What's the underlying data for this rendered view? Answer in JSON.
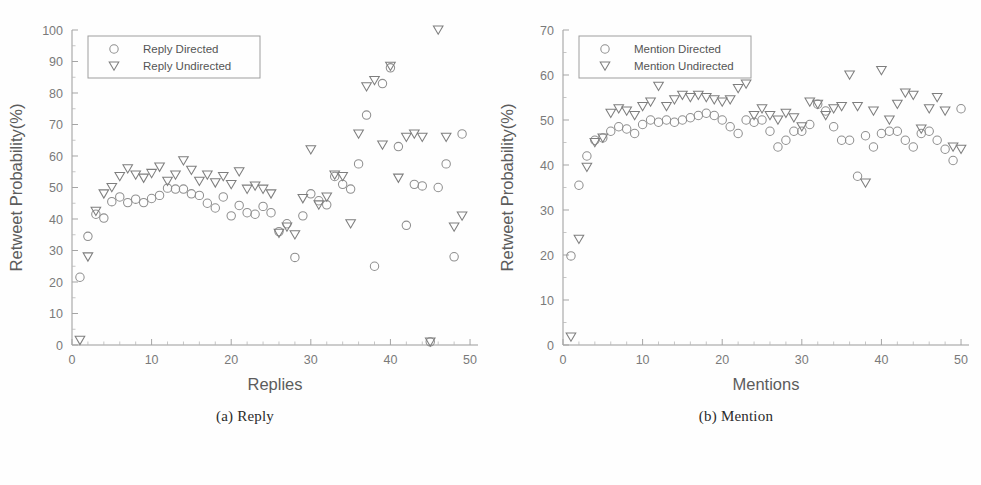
{
  "figure": {
    "background_color": "#fefefe",
    "marker_circle_color": "#8f8f8f",
    "marker_triangle_color": "#7e7e7e",
    "axis_color": "#9a9a9a"
  },
  "panels": [
    {
      "key": "reply",
      "caption": "(a) Reply",
      "chart_data": {
        "type": "scatter",
        "title": "",
        "xlabel": "Replies",
        "ylabel": "Retweet Probability(%)",
        "xlim": [
          0,
          51
        ],
        "ylim": [
          0,
          100
        ],
        "xticks": [
          0,
          10,
          20,
          30,
          40,
          50
        ],
        "yticks": [
          0,
          10,
          20,
          30,
          40,
          50,
          60,
          70,
          80,
          90,
          100
        ],
        "grid": false,
        "legend_position": "top-left",
        "series": [
          {
            "name": "Reply Directed",
            "marker": "circle",
            "x": [
              1,
              2,
              3,
              4,
              5,
              6,
              7,
              8,
              9,
              10,
              11,
              12,
              13,
              14,
              15,
              16,
              17,
              18,
              19,
              20,
              21,
              22,
              23,
              24,
              25,
              26,
              27,
              28,
              29,
              30,
              31,
              32,
              33,
              34,
              35,
              36,
              37,
              38,
              39,
              40,
              41,
              42,
              43,
              44,
              45,
              46,
              47,
              48,
              49
            ],
            "values": [
              21.5,
              34.5,
              41.5,
              40.3,
              45.5,
              47.0,
              45.2,
              46.3,
              45.2,
              46.5,
              47.5,
              49.8,
              49.5,
              49.5,
              48.0,
              47.5,
              45.0,
              43.5,
              47.0,
              41.0,
              44.3,
              42.0,
              41.5,
              44.0,
              42.0,
              36.0,
              38.5,
              27.8,
              41.0,
              48.0,
              45.8,
              44.5,
              53.5,
              51.0,
              49.5,
              57.5,
              73.0,
              25.0,
              83.0,
              88.0,
              63.0,
              38.0,
              51.0,
              50.5,
              1.0,
              50.0,
              57.5,
              28.0,
              67.0
            ]
          },
          {
            "name": "Reply Undirected",
            "marker": "triangle",
            "x": [
              1,
              2,
              3,
              4,
              5,
              6,
              7,
              8,
              9,
              10,
              11,
              12,
              13,
              14,
              15,
              16,
              17,
              18,
              19,
              20,
              21,
              22,
              23,
              24,
              25,
              26,
              27,
              28,
              29,
              30,
              31,
              32,
              33,
              34,
              35,
              36,
              37,
              38,
              39,
              40,
              41,
              42,
              43,
              44,
              45,
              46,
              47,
              48,
              49
            ],
            "values": [
              1.5,
              28.0,
              42.5,
              48.0,
              50.0,
              53.5,
              56.0,
              54.0,
              53.0,
              54.5,
              56.5,
              52.0,
              54.0,
              58.5,
              55.5,
              52.0,
              54.0,
              51.5,
              53.5,
              51.0,
              55.0,
              49.5,
              50.5,
              49.5,
              48.0,
              35.5,
              37.5,
              35.0,
              46.5,
              62.0,
              44.5,
              47.0,
              54.0,
              53.5,
              38.5,
              67.0,
              82.0,
              84.0,
              63.5,
              88.5,
              53.0,
              66.0,
              67.0,
              66.0,
              1.0,
              100.0,
              66.0,
              37.5,
              41.0
            ]
          }
        ]
      }
    },
    {
      "key": "mention",
      "caption": "(b) Mention",
      "chart_data": {
        "type": "scatter",
        "title": "",
        "xlabel": "Mentions",
        "ylabel": "Retweet Probability(%)",
        "xlim": [
          0,
          51
        ],
        "ylim": [
          0,
          70
        ],
        "xticks": [
          0,
          10,
          20,
          30,
          40,
          50
        ],
        "yticks": [
          0,
          10,
          20,
          30,
          40,
          50,
          60,
          70
        ],
        "grid": false,
        "legend_position": "top-left",
        "series": [
          {
            "name": "Mention Directed",
            "marker": "circle",
            "x": [
              1,
              2,
              3,
              4,
              5,
              6,
              7,
              8,
              9,
              10,
              11,
              12,
              13,
              14,
              15,
              16,
              17,
              18,
              19,
              20,
              21,
              22,
              23,
              24,
              25,
              26,
              27,
              28,
              29,
              30,
              31,
              32,
              33,
              34,
              35,
              36,
              37,
              38,
              39,
              40,
              41,
              42,
              43,
              44,
              45,
              46,
              47,
              48,
              49,
              50
            ],
            "values": [
              19.8,
              35.5,
              42.0,
              45.5,
              46.0,
              47.5,
              48.5,
              48.0,
              47.0,
              49.0,
              50.0,
              49.5,
              50.0,
              49.5,
              50.0,
              50.5,
              51.0,
              51.5,
              51.0,
              50.0,
              48.5,
              47.0,
              50.0,
              49.5,
              50.0,
              47.5,
              44.0,
              45.5,
              47.5,
              47.5,
              49.0,
              53.5,
              52.0,
              48.5,
              45.5,
              45.5,
              37.5,
              46.5,
              44.0,
              47.0,
              47.5,
              47.5,
              45.5,
              44.0,
              47.0,
              47.5,
              45.5,
              43.5,
              41.0,
              52.5
            ]
          },
          {
            "name": "Mention Undirected",
            "marker": "triangle",
            "x": [
              1,
              2,
              3,
              4,
              5,
              6,
              7,
              8,
              9,
              10,
              11,
              12,
              13,
              14,
              15,
              16,
              17,
              18,
              19,
              20,
              21,
              22,
              23,
              24,
              25,
              26,
              27,
              28,
              29,
              30,
              31,
              32,
              33,
              34,
              35,
              36,
              37,
              38,
              39,
              40,
              41,
              42,
              43,
              44,
              45,
              46,
              47,
              48,
              49,
              50
            ],
            "values": [
              1.8,
              23.5,
              39.5,
              45.0,
              46.0,
              51.5,
              52.5,
              52.0,
              51.0,
              53.0,
              54.0,
              57.5,
              53.0,
              54.5,
              55.5,
              55.0,
              55.5,
              55.0,
              54.5,
              54.0,
              54.5,
              57.0,
              58.0,
              51.0,
              52.5,
              51.0,
              50.0,
              51.5,
              50.5,
              48.5,
              54.0,
              53.5,
              51.0,
              52.5,
              53.0,
              60.0,
              53.0,
              36.0,
              52.0,
              61.0,
              50.0,
              53.5,
              56.0,
              55.5,
              48.0,
              52.5,
              55.0,
              52.0,
              44.0,
              43.5
            ]
          }
        ]
      }
    }
  ]
}
